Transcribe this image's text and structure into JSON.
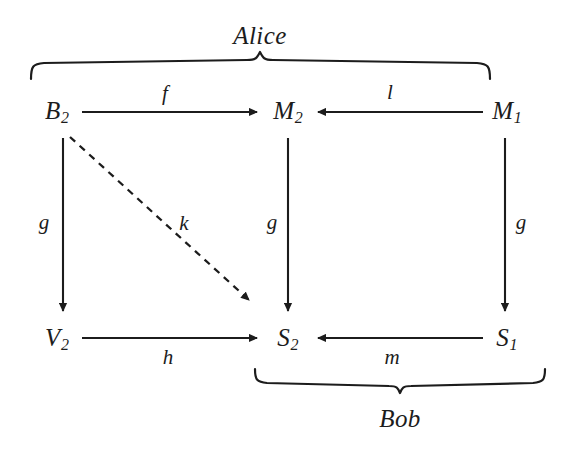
{
  "figure": {
    "kind": "commutative-diagram",
    "background_color": "#ffffff",
    "stroke_color": "#1c1c1c"
  },
  "nodes": [
    {
      "id": "B2",
      "base": "B",
      "sub": "2",
      "x": 57,
      "y": 112
    },
    {
      "id": "M2",
      "base": "M",
      "sub": "2",
      "x": 288,
      "y": 112
    },
    {
      "id": "M1",
      "base": "M",
      "sub": "1",
      "x": 507,
      "y": 112
    },
    {
      "id": "V2",
      "base": "V",
      "sub": "2",
      "x": 57,
      "y": 339
    },
    {
      "id": "S2",
      "base": "S",
      "sub": "2",
      "x": 288,
      "y": 339
    },
    {
      "id": "S1",
      "base": "S",
      "sub": "1",
      "x": 507,
      "y": 339
    }
  ],
  "edges": [
    {
      "id": "f",
      "label": "f",
      "from": "B2",
      "to": "M2",
      "style": "solid",
      "label_x": 165,
      "label_y": 93
    },
    {
      "id": "l",
      "label": "l",
      "from": "M1",
      "to": "M2",
      "style": "solid",
      "label_x": 390,
      "label_y": 92
    },
    {
      "id": "g-left",
      "label": "g",
      "from": "B2",
      "to": "V2",
      "style": "solid",
      "label_x": 44,
      "label_y": 222
    },
    {
      "id": "g-middle",
      "label": "g",
      "from": "M2",
      "to": "S2",
      "style": "solid",
      "label_x": 272,
      "label_y": 222
    },
    {
      "id": "g-right",
      "label": "g",
      "from": "M1",
      "to": "S1",
      "style": "solid",
      "label_x": 521,
      "label_y": 222
    },
    {
      "id": "k",
      "label": "k",
      "from": "B2",
      "to": "S2",
      "style": "dashed",
      "label_x": 184,
      "label_y": 223
    },
    {
      "id": "h",
      "label": "h",
      "from": "V2",
      "to": "S2",
      "style": "solid",
      "label_x": 168,
      "label_y": 357
    },
    {
      "id": "m",
      "label": "m",
      "from": "S1",
      "to": "S2",
      "style": "solid",
      "label_x": 392,
      "label_y": 357
    }
  ],
  "groups": [
    {
      "id": "alice",
      "label": "Alice",
      "brace": "top",
      "x1": 31,
      "x2": 490,
      "label_x": 260,
      "label_y": 36
    },
    {
      "id": "bob",
      "label": "Bob",
      "brace": "bottom",
      "x1": 255,
      "x2": 545,
      "label_x": 400,
      "label_y": 419
    }
  ]
}
